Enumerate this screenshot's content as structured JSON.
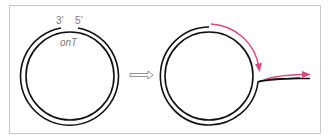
{
  "diagram": {
    "left_panel": {
      "label_3prime": "3’",
      "label_5prime": "5’",
      "origin_label": "onT"
    },
    "transition_arrow": "hollow-right-arrow",
    "right_panel": {
      "description": "Displaced 5’ strand peels off while new synthesis proceeds around the circle"
    },
    "colors": {
      "strand": "#111111",
      "new_synthesis": "#d94a7a",
      "frame": "#c8c8c8",
      "label": "#7a7a7a"
    }
  }
}
